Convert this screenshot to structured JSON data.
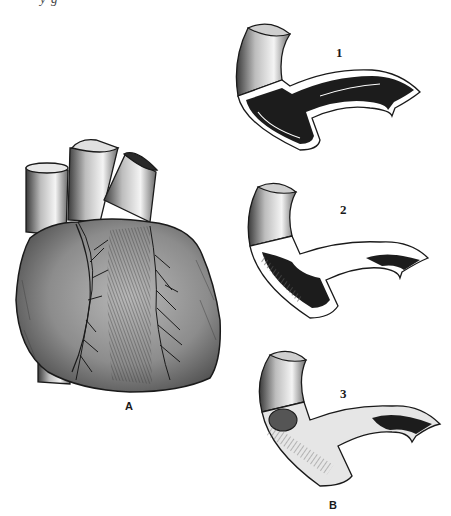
{
  "figure": {
    "top_caption_cut": "y                        g",
    "panel_a": {
      "label": "A",
      "subject": "heart-anterior-view"
    },
    "panel_b": {
      "label": "B",
      "stages": [
        {
          "number": "1",
          "description": "artery-open-lumen"
        },
        {
          "number": "2",
          "description": "artery-partial-plaque"
        },
        {
          "number": "3",
          "description": "artery-occluded"
        }
      ]
    },
    "colors": {
      "ink": "#1a1a1a",
      "lumen": "#1c1c1c",
      "shade": "#7a7a7a",
      "paper": "#ffffff"
    }
  }
}
